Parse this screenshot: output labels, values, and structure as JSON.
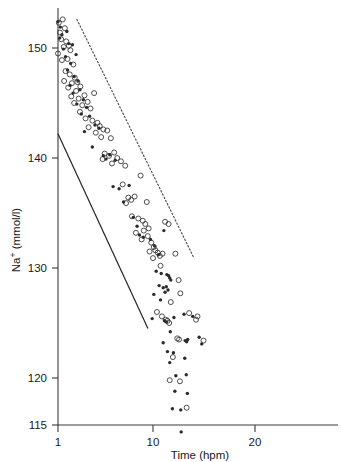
{
  "figure": {
    "background": "#ffffff",
    "ink_color": "#2b2b2b"
  },
  "axes": {
    "y_title_main": "Na",
    "y_title_sup": "+",
    "y_title_rest": " (mmol/l)",
    "y_title_full": "Na+ (mmol/l)",
    "x_title": "Time (hpm)",
    "y_ticks": [
      "115",
      "120",
      "130",
      "140",
      "150"
    ],
    "y_tick_values": [
      115,
      120,
      130,
      140,
      150
    ],
    "x_ticks": [
      "1",
      "10",
      "20"
    ],
    "x_tick_values": [
      1,
      10,
      20
    ]
  },
  "chart_data": {
    "type": "scatter",
    "title": "",
    "xlabel": "Time (hpm)",
    "ylabel": "Na+ (mmol/l)",
    "xscale": "log",
    "yscale": "linear",
    "xlim": [
      0.95,
      36
    ],
    "ylim": [
      115,
      153.2
    ],
    "grid": false,
    "legend": null,
    "series": [
      {
        "name": "open-circle-series",
        "marker": "open-circle",
        "color": "#2f2f2f",
        "points": [
          [
            1.02,
            152.3
          ],
          [
            1.12,
            152.6
          ],
          [
            1.05,
            151.4
          ],
          [
            1.18,
            151.8
          ],
          [
            1.08,
            150.8
          ],
          [
            1.22,
            150.6
          ],
          [
            1.0,
            149.5
          ],
          [
            1.15,
            150.1
          ],
          [
            1.3,
            150.2
          ],
          [
            1.35,
            149.8
          ],
          [
            1.26,
            149.0
          ],
          [
            1.1,
            148.9
          ],
          [
            1.45,
            148.5
          ],
          [
            1.2,
            147.9
          ],
          [
            1.33,
            147.6
          ],
          [
            1.5,
            147.3
          ],
          [
            1.16,
            147.0
          ],
          [
            1.4,
            146.8
          ],
          [
            1.6,
            146.9
          ],
          [
            1.28,
            146.4
          ],
          [
            1.55,
            146.1
          ],
          [
            1.72,
            146.5
          ],
          [
            1.38,
            145.6
          ],
          [
            1.65,
            145.4
          ],
          [
            1.9,
            145.7
          ],
          [
            1.48,
            145.0
          ],
          [
            1.8,
            144.8
          ],
          [
            2.05,
            145.1
          ],
          [
            1.7,
            144.2
          ],
          [
            2.2,
            144.5
          ],
          [
            2.4,
            145.9
          ],
          [
            1.95,
            143.6
          ],
          [
            2.3,
            143.4
          ],
          [
            2.6,
            143.2
          ],
          [
            2.1,
            142.8
          ],
          [
            2.75,
            142.9
          ],
          [
            3.0,
            142.6
          ],
          [
            2.5,
            142.3
          ],
          [
            3.3,
            142.5
          ],
          [
            2.85,
            141.9
          ],
          [
            3.6,
            141.8
          ],
          [
            3.1,
            140.4
          ],
          [
            3.45,
            140.2
          ],
          [
            3.9,
            140.5
          ],
          [
            2.95,
            139.9
          ],
          [
            4.2,
            140.0
          ],
          [
            4.6,
            139.7
          ],
          [
            3.7,
            139.5
          ],
          [
            5.1,
            139.3
          ],
          [
            7.4,
            138.4
          ],
          [
            4.8,
            137.6
          ],
          [
            5.5,
            136.4
          ],
          [
            5.9,
            136.2
          ],
          [
            6.4,
            136.5
          ],
          [
            8.6,
            136.0
          ],
          [
            5.2,
            135.9
          ],
          [
            6.0,
            134.7
          ],
          [
            7.0,
            134.5
          ],
          [
            7.8,
            134.3
          ],
          [
            8.3,
            134.0
          ],
          [
            6.6,
            133.2
          ],
          [
            8.0,
            133.4
          ],
          [
            9.0,
            133.6
          ],
          [
            8.8,
            132.9
          ],
          [
            7.6,
            132.6
          ],
          [
            9.6,
            132.3
          ],
          [
            10.2,
            131.9
          ],
          [
            9.2,
            131.5
          ],
          [
            10.6,
            131.6
          ],
          [
            11.2,
            131.4
          ],
          [
            10.0,
            130.9
          ],
          [
            11.8,
            131.1
          ],
          [
            12.6,
            131.3
          ],
          [
            12.0,
            130.2
          ],
          [
            13.4,
            134.2
          ],
          [
            14.6,
            134.0
          ],
          [
            17.2,
            131.3
          ],
          [
            18.6,
            128.9
          ],
          [
            19.4,
            127.7
          ],
          [
            15.4,
            126.9
          ],
          [
            11.0,
            126.0
          ],
          [
            12.4,
            125.6
          ],
          [
            13.6,
            125.3
          ],
          [
            14.2,
            125.2
          ],
          [
            14.8,
            125.0
          ],
          [
            24.0,
            125.9
          ],
          [
            28.4,
            125.3
          ],
          [
            29.4,
            125.6
          ],
          [
            18.0,
            123.6
          ],
          [
            18.8,
            123.5
          ],
          [
            34.0,
            123.4
          ],
          [
            16.2,
            121.9
          ],
          [
            19.2,
            119.7
          ],
          [
            15.0,
            119.8
          ],
          [
            22.6,
            117.3
          ]
        ]
      },
      {
        "name": "filled-dot-series",
        "marker": "filled-dot",
        "color": "#2b2b2b",
        "points": [
          [
            1.0,
            152.4
          ],
          [
            1.06,
            151.9
          ],
          [
            1.1,
            151.2
          ],
          [
            1.04,
            150.9
          ],
          [
            1.24,
            151.5
          ],
          [
            1.3,
            150.4
          ],
          [
            1.14,
            149.9
          ],
          [
            1.42,
            150.3
          ],
          [
            1.2,
            149.2
          ],
          [
            1.36,
            148.6
          ],
          [
            1.55,
            149.4
          ],
          [
            1.26,
            148.0
          ],
          [
            1.48,
            147.4
          ],
          [
            1.62,
            147.0
          ],
          [
            1.34,
            146.6
          ],
          [
            1.7,
            146.2
          ],
          [
            1.44,
            145.9
          ],
          [
            1.85,
            145.3
          ],
          [
            1.58,
            144.9
          ],
          [
            2.0,
            144.6
          ],
          [
            1.76,
            144.0
          ],
          [
            2.15,
            143.8
          ],
          [
            2.45,
            143.0
          ],
          [
            2.7,
            142.7
          ],
          [
            1.9,
            142.4
          ],
          [
            3.0,
            140.2
          ],
          [
            3.2,
            139.9
          ],
          [
            2.3,
            141.0
          ],
          [
            3.5,
            140.3
          ],
          [
            4.0,
            139.8
          ],
          [
            3.8,
            137.4
          ],
          [
            4.4,
            137.2
          ],
          [
            5.6,
            137.5
          ],
          [
            4.9,
            136.0
          ],
          [
            6.2,
            134.6
          ],
          [
            6.8,
            133.8
          ],
          [
            7.2,
            133.0
          ],
          [
            7.9,
            132.8
          ],
          [
            9.4,
            132.6
          ],
          [
            10.4,
            132.0
          ],
          [
            11.4,
            131.2
          ],
          [
            13.0,
            133.4
          ],
          [
            10.8,
            129.7
          ],
          [
            12.2,
            129.5
          ],
          [
            11.6,
            128.4
          ],
          [
            12.8,
            128.2
          ],
          [
            10.2,
            127.6
          ],
          [
            12.0,
            127.1
          ],
          [
            14.0,
            129.4
          ],
          [
            14.6,
            129.3
          ],
          [
            15.0,
            129.1
          ],
          [
            15.4,
            128.9
          ],
          [
            13.8,
            128.3
          ],
          [
            14.4,
            128.0
          ],
          [
            13.4,
            127.8
          ],
          [
            9.8,
            125.4
          ],
          [
            13.2,
            125.2
          ],
          [
            13.8,
            125.1
          ],
          [
            16.6,
            125.5
          ],
          [
            21.2,
            125.8
          ],
          [
            26.2,
            125.6
          ],
          [
            15.2,
            124.2
          ],
          [
            30.6,
            123.7
          ],
          [
            21.8,
            123.4
          ],
          [
            22.6,
            123.3
          ],
          [
            23.2,
            123.5
          ],
          [
            32.6,
            123.1
          ],
          [
            12.8,
            123.2
          ],
          [
            14.2,
            122.4
          ],
          [
            16.4,
            122.3
          ],
          [
            15.0,
            121.4
          ],
          [
            21.6,
            121.8
          ],
          [
            17.4,
            120.2
          ],
          [
            22.4,
            120.3
          ],
          [
            17.0,
            118.8
          ],
          [
            23.0,
            118.6
          ],
          [
            16.0,
            117.2
          ],
          [
            19.6,
            117.1
          ],
          [
            19.8,
            115.1
          ]
        ]
      }
    ],
    "annotations": [
      {
        "name": "upper-dotted-reference-curve",
        "style": "dotted",
        "description": "Upper bound reference curve declining from ~152 at 1.6 hpm to ~128 at 26 hpm"
      },
      {
        "name": "lower-solid-reference-curve",
        "style": "solid",
        "description": "Lower bound reference curve declining from ~142 at 1.0 hpm to ~124.5 at 8.8 hpm"
      }
    ]
  }
}
